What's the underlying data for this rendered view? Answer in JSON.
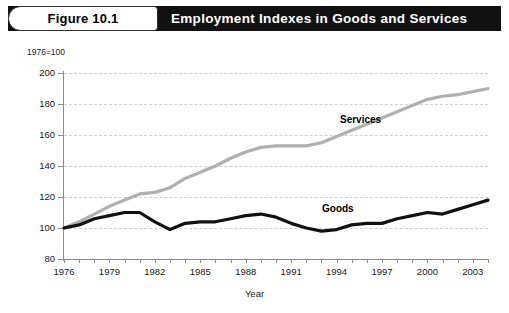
{
  "figure": {
    "number_label": "Figure 10.1",
    "title": "Employment Indexes in Goods and Services"
  },
  "chart_data": {
    "type": "line",
    "title": "Employment Indexes in Goods and Services",
    "xlabel": "Year",
    "ylabel": "",
    "y_axis_note": "1976=100",
    "xlim": [
      1976,
      2004
    ],
    "ylim": [
      80,
      200
    ],
    "y_ticks": [
      80,
      100,
      120,
      140,
      160,
      180,
      200
    ],
    "x_ticks": [
      1976,
      1977,
      1978,
      1979,
      1980,
      1981,
      1982,
      1983,
      1984,
      1985,
      1986,
      1987,
      1988,
      1989,
      1990,
      1991,
      1992,
      1993,
      1994,
      1995,
      1996,
      1997,
      1998,
      1999,
      2000,
      2001,
      2002,
      2003,
      2004
    ],
    "x_tick_labels": [
      "1976",
      "",
      "",
      "1979",
      "",
      "",
      "1982",
      "",
      "",
      "1985",
      "",
      "",
      "1988",
      "",
      "",
      "1991",
      "",
      "",
      "1994",
      "",
      "",
      "1997",
      "",
      "",
      "2000",
      "",
      "",
      "2003",
      ""
    ],
    "x_labeled_years": [
      1976,
      1979,
      1982,
      1985,
      1988,
      1991,
      1994,
      1997,
      2000,
      2003
    ],
    "grid": true,
    "grid_style": "dashed-horizontal",
    "legend_position": "inline-annotation",
    "x": [
      1976,
      1977,
      1978,
      1979,
      1980,
      1981,
      1982,
      1983,
      1984,
      1985,
      1986,
      1987,
      1988,
      1989,
      1990,
      1991,
      1992,
      1993,
      1994,
      1995,
      1996,
      1997,
      1998,
      1999,
      2000,
      2001,
      2002,
      2003,
      2004
    ],
    "series": [
      {
        "name": "Services",
        "color": "#b0b0b0",
        "line_width": 3.2,
        "label_text": "Services",
        "values": [
          100,
          104,
          109,
          114,
          118,
          122,
          123,
          126,
          132,
          136,
          140,
          145,
          149,
          152,
          153,
          153,
          153,
          155,
          159,
          163,
          167,
          171,
          175,
          179,
          183,
          185,
          186,
          188,
          190
        ]
      },
      {
        "name": "Goods",
        "color": "#111111",
        "line_width": 3.2,
        "label_text": "Goods",
        "values": [
          100,
          102,
          106,
          108,
          110,
          110,
          104,
          99,
          103,
          104,
          104,
          106,
          108,
          109,
          107,
          103,
          100,
          98,
          99,
          102,
          103,
          103,
          106,
          108,
          110,
          109,
          112,
          115,
          118
        ]
      }
    ]
  }
}
